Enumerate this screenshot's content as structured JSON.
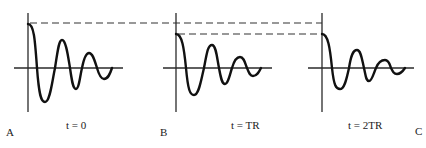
{
  "diagram": {
    "panels": [
      {
        "id": "A",
        "label": "A",
        "time_label": "t = 0",
        "relative_amplitude": 1.0
      },
      {
        "id": "B",
        "label": "B",
        "time_label": "t = TR",
        "relative_amplitude": 0.77
      },
      {
        "id": "C",
        "label": "C",
        "time_label": "t = 2TR",
        "relative_amplitude": 0.77
      }
    ],
    "reference_lines": [
      {
        "name": "initial-amplitude-reference",
        "style": "dashed"
      },
      {
        "name": "reduced-amplitude-reference",
        "style": "dashed"
      }
    ]
  }
}
